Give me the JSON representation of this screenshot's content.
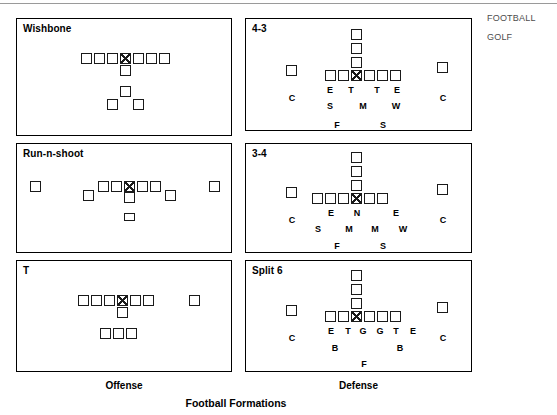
{
  "figure": {
    "title": "Football Formations",
    "offense_caption": "Offense",
    "defense_caption": "Defense"
  },
  "categories": [
    {
      "label": "FOOTBALL"
    },
    {
      "label": "GOLF"
    }
  ],
  "panels": [
    {
      "id": "wishbone",
      "title": "Wishbone",
      "side": "offense",
      "rect": {
        "x": 16,
        "y": 18,
        "w": 216,
        "h": 118
      },
      "boxes": [
        {
          "name": "lineman-1",
          "x": 81,
          "y": 53,
          "center": false
        },
        {
          "name": "lineman-2",
          "x": 94,
          "y": 53,
          "center": false
        },
        {
          "name": "lineman-3",
          "x": 107,
          "y": 53,
          "center": false
        },
        {
          "name": "center",
          "x": 120,
          "y": 53,
          "center": true
        },
        {
          "name": "lineman-4",
          "x": 133,
          "y": 53,
          "center": false
        },
        {
          "name": "lineman-5",
          "x": 146,
          "y": 53,
          "center": false
        },
        {
          "name": "lineman-6",
          "x": 159,
          "y": 53,
          "center": false
        },
        {
          "name": "quarterback",
          "x": 120,
          "y": 65,
          "center": false
        },
        {
          "name": "fullback",
          "x": 120,
          "y": 86,
          "center": false
        },
        {
          "name": "halfback-l",
          "x": 107,
          "y": 99,
          "center": false
        },
        {
          "name": "halfback-r",
          "x": 133,
          "y": 99,
          "center": false
        }
      ],
      "labels": []
    },
    {
      "id": "run-n-shoot",
      "title": "Run-n-shoot",
      "side": "offense",
      "rect": {
        "x": 16,
        "y": 143,
        "w": 216,
        "h": 110
      },
      "boxes": [
        {
          "name": "wideout-left",
          "x": 30,
          "y": 181,
          "center": false
        },
        {
          "name": "slot-left",
          "x": 83,
          "y": 190,
          "center": false
        },
        {
          "name": "lineman-1",
          "x": 98,
          "y": 181,
          "center": false
        },
        {
          "name": "lineman-2",
          "x": 111,
          "y": 181,
          "center": false
        },
        {
          "name": "center",
          "x": 124,
          "y": 181,
          "center": true
        },
        {
          "name": "lineman-3",
          "x": 137,
          "y": 181,
          "center": false
        },
        {
          "name": "lineman-4",
          "x": 150,
          "y": 181,
          "center": false
        },
        {
          "name": "slot-right",
          "x": 165,
          "y": 190,
          "center": false
        },
        {
          "name": "wideout-right",
          "x": 209,
          "y": 181,
          "center": false
        },
        {
          "name": "quarterback",
          "x": 124,
          "y": 192,
          "center": false
        },
        {
          "name": "runningback",
          "x": 124,
          "y": 213,
          "center": false,
          "flat": true
        }
      ],
      "labels": []
    },
    {
      "id": "t-formation",
      "title": "T",
      "side": "offense",
      "rect": {
        "x": 16,
        "y": 260,
        "w": 216,
        "h": 112
      },
      "boxes": [
        {
          "name": "lineman-1",
          "x": 78,
          "y": 295,
          "center": false
        },
        {
          "name": "lineman-2",
          "x": 91,
          "y": 295,
          "center": false
        },
        {
          "name": "lineman-3",
          "x": 104,
          "y": 295,
          "center": false
        },
        {
          "name": "center",
          "x": 117,
          "y": 295,
          "center": true
        },
        {
          "name": "lineman-4",
          "x": 130,
          "y": 295,
          "center": false
        },
        {
          "name": "lineman-5",
          "x": 143,
          "y": 295,
          "center": false
        },
        {
          "name": "split-end",
          "x": 189,
          "y": 295,
          "center": false
        },
        {
          "name": "quarterback",
          "x": 117,
          "y": 307,
          "center": false
        },
        {
          "name": "back-left",
          "x": 100,
          "y": 328,
          "center": false
        },
        {
          "name": "back-mid",
          "x": 113,
          "y": 328,
          "center": false
        },
        {
          "name": "back-right",
          "x": 126,
          "y": 328,
          "center": false
        }
      ],
      "labels": []
    },
    {
      "id": "four-three",
      "title": "4-3",
      "side": "defense",
      "rect": {
        "x": 245,
        "y": 18,
        "w": 227,
        "h": 113
      },
      "boxes": [
        {
          "name": "safety-deep",
          "x": 351,
          "y": 29,
          "center": false
        },
        {
          "name": "safety-mid",
          "x": 351,
          "y": 43,
          "center": false
        },
        {
          "name": "linebacker-m",
          "x": 351,
          "y": 57,
          "center": false
        },
        {
          "name": "cornerback-l",
          "x": 286,
          "y": 65,
          "center": false
        },
        {
          "name": "end-left",
          "x": 325,
          "y": 70,
          "center": false
        },
        {
          "name": "tackle-left",
          "x": 338,
          "y": 70,
          "center": false
        },
        {
          "name": "center",
          "x": 351,
          "y": 70,
          "center": true
        },
        {
          "name": "tackle-right",
          "x": 364,
          "y": 70,
          "center": false
        },
        {
          "name": "end-right",
          "x": 377,
          "y": 70,
          "center": false
        },
        {
          "name": "extra-right",
          "x": 390,
          "y": 70,
          "center": false
        },
        {
          "name": "cornerback-r",
          "x": 437,
          "y": 62,
          "center": false
        }
      ],
      "labels": [
        {
          "name": "label-end-left",
          "text": "E",
          "x": 330,
          "y": 85
        },
        {
          "name": "label-tackle-left",
          "text": "T",
          "x": 351,
          "y": 85
        },
        {
          "name": "label-tackle-right",
          "text": "T",
          "x": 377,
          "y": 85
        },
        {
          "name": "label-end-right",
          "text": "E",
          "x": 397,
          "y": 85
        },
        {
          "name": "label-cornerback-l",
          "text": "C",
          "x": 292,
          "y": 93
        },
        {
          "name": "label-cornerback-r",
          "text": "C",
          "x": 443,
          "y": 93
        },
        {
          "name": "label-sam",
          "text": "S",
          "x": 330,
          "y": 101
        },
        {
          "name": "label-mike",
          "text": "M",
          "x": 363,
          "y": 101
        },
        {
          "name": "label-will",
          "text": "W",
          "x": 396,
          "y": 101
        },
        {
          "name": "label-free-safety",
          "text": "F",
          "x": 337,
          "y": 120
        },
        {
          "name": "label-strong-safety",
          "text": "S",
          "x": 383,
          "y": 120
        }
      ]
    },
    {
      "id": "three-four",
      "title": "3-4",
      "side": "defense",
      "rect": {
        "x": 245,
        "y": 143,
        "w": 227,
        "h": 110
      },
      "boxes": [
        {
          "name": "safety-deep",
          "x": 351,
          "y": 152,
          "center": false
        },
        {
          "name": "safety-mid",
          "x": 351,
          "y": 166,
          "center": false
        },
        {
          "name": "linebacker-m",
          "x": 351,
          "y": 180,
          "center": false
        },
        {
          "name": "cornerback-l",
          "x": 286,
          "y": 187,
          "center": false
        },
        {
          "name": "lineman-1",
          "x": 312,
          "y": 193,
          "center": false
        },
        {
          "name": "lineman-2",
          "x": 325,
          "y": 193,
          "center": false
        },
        {
          "name": "lineman-3",
          "x": 338,
          "y": 193,
          "center": false
        },
        {
          "name": "center",
          "x": 351,
          "y": 193,
          "center": true
        },
        {
          "name": "lineman-4",
          "x": 364,
          "y": 193,
          "center": false
        },
        {
          "name": "lineman-5",
          "x": 377,
          "y": 193,
          "center": false
        },
        {
          "name": "cornerback-r",
          "x": 437,
          "y": 184,
          "center": false
        }
      ],
      "labels": [
        {
          "name": "label-end-left",
          "text": "E",
          "x": 331,
          "y": 208
        },
        {
          "name": "label-nose-tackle",
          "text": "N",
          "x": 357,
          "y": 208
        },
        {
          "name": "label-end-right",
          "text": "E",
          "x": 396,
          "y": 208
        },
        {
          "name": "label-cornerback-l",
          "text": "C",
          "x": 292,
          "y": 215
        },
        {
          "name": "label-cornerback-r",
          "text": "C",
          "x": 443,
          "y": 215
        },
        {
          "name": "label-sam",
          "text": "S",
          "x": 318,
          "y": 224
        },
        {
          "name": "label-mike-left",
          "text": "M",
          "x": 349,
          "y": 224
        },
        {
          "name": "label-mike-right",
          "text": "M",
          "x": 375,
          "y": 224
        },
        {
          "name": "label-will",
          "text": "W",
          "x": 403,
          "y": 224
        },
        {
          "name": "label-free-safety",
          "text": "F",
          "x": 337,
          "y": 241
        },
        {
          "name": "label-strong-safety",
          "text": "S",
          "x": 383,
          "y": 241
        }
      ]
    },
    {
      "id": "split-six",
      "title": "Split 6",
      "side": "defense",
      "rect": {
        "x": 245,
        "y": 260,
        "w": 227,
        "h": 112
      },
      "boxes": [
        {
          "name": "safety-deep",
          "x": 351,
          "y": 270,
          "center": false
        },
        {
          "name": "safety-mid",
          "x": 351,
          "y": 284,
          "center": false
        },
        {
          "name": "linebacker-m",
          "x": 351,
          "y": 298,
          "center": false
        },
        {
          "name": "cornerback-l",
          "x": 286,
          "y": 305,
          "center": false
        },
        {
          "name": "end-left",
          "x": 325,
          "y": 311,
          "center": false
        },
        {
          "name": "tackle-left",
          "x": 338,
          "y": 311,
          "center": false
        },
        {
          "name": "center",
          "x": 351,
          "y": 311,
          "center": true
        },
        {
          "name": "guard-right",
          "x": 364,
          "y": 311,
          "center": false
        },
        {
          "name": "tackle-right",
          "x": 377,
          "y": 311,
          "center": false
        },
        {
          "name": "end-right",
          "x": 390,
          "y": 311,
          "center": false
        },
        {
          "name": "cornerback-r",
          "x": 437,
          "y": 302,
          "center": false
        }
      ],
      "labels": [
        {
          "name": "label-end-left",
          "text": "E",
          "x": 331,
          "y": 326
        },
        {
          "name": "label-tackle-left",
          "text": "T",
          "x": 348,
          "y": 326
        },
        {
          "name": "label-guard-left",
          "text": "G",
          "x": 363,
          "y": 326
        },
        {
          "name": "label-guard-right",
          "text": "G",
          "x": 380,
          "y": 326
        },
        {
          "name": "label-tackle-right",
          "text": "T",
          "x": 396,
          "y": 326
        },
        {
          "name": "label-end-right",
          "text": "E",
          "x": 413,
          "y": 326
        },
        {
          "name": "label-cornerback-l",
          "text": "C",
          "x": 292,
          "y": 333
        },
        {
          "name": "label-cornerback-r",
          "text": "C",
          "x": 443,
          "y": 333
        },
        {
          "name": "label-backer-left",
          "text": "B",
          "x": 335,
          "y": 343
        },
        {
          "name": "label-backer-right",
          "text": "B",
          "x": 400,
          "y": 343
        },
        {
          "name": "label-fullback",
          "text": "F",
          "x": 364,
          "y": 359
        }
      ]
    }
  ]
}
